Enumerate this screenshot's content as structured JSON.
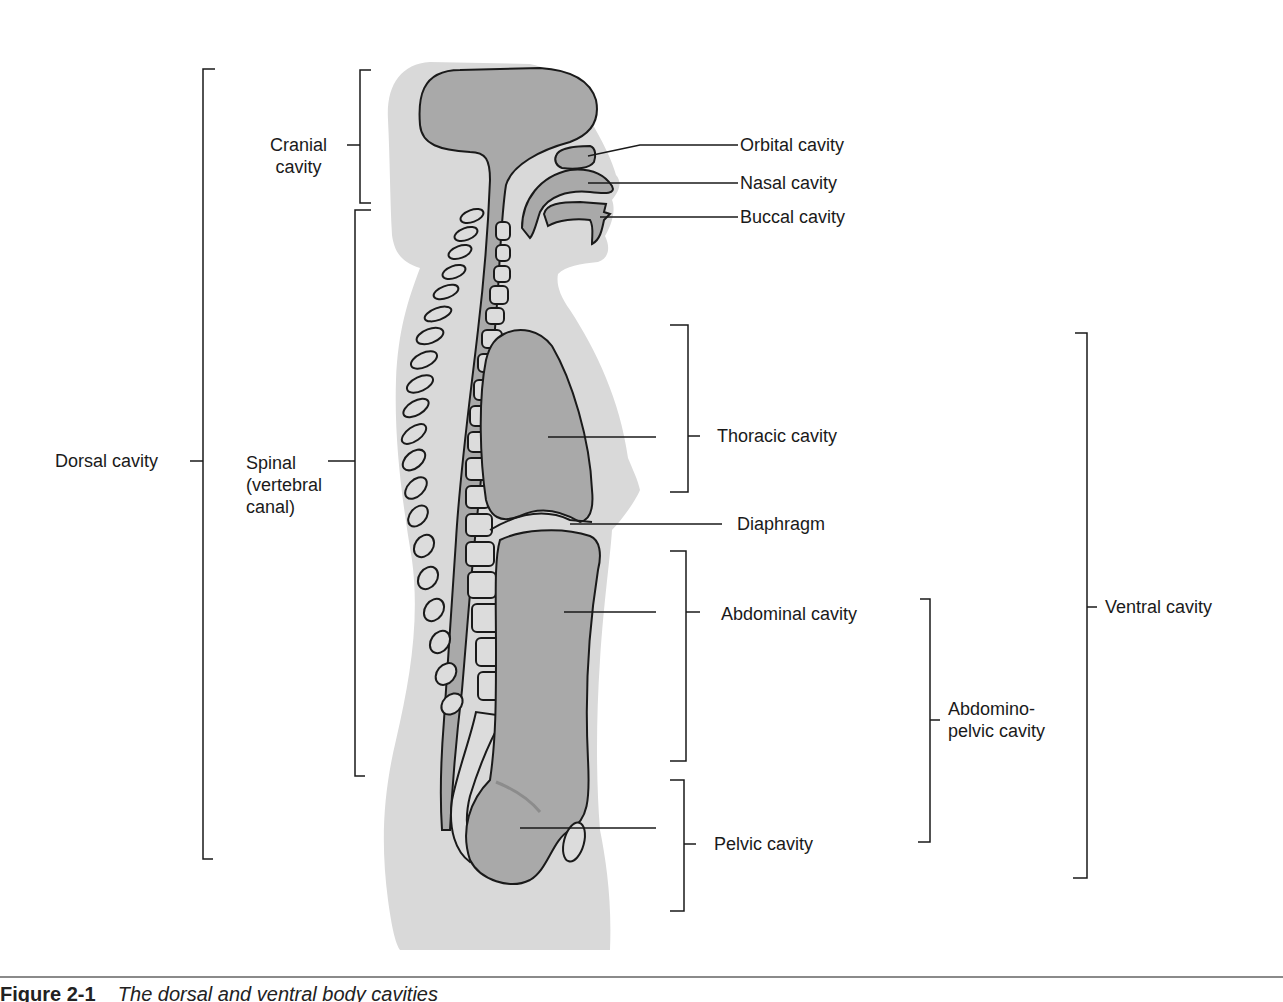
{
  "figure": {
    "type": "anatomical-diagram",
    "colors": {
      "body_fill": "#d9d9d9",
      "cavity_fill": "#a9a9a9",
      "outline": "#1a1a1a",
      "background": "#ffffff"
    }
  },
  "labels": {
    "cranial_cavity": "Cranial\ncavity",
    "dorsal_cavity": "Dorsal cavity",
    "spinal_canal": "Spinal\n(vertebral\ncanal)",
    "orbital_cavity": "Orbital cavity",
    "nasal_cavity": "Nasal cavity",
    "buccal_cavity": "Buccal cavity",
    "thoracic_cavity": "Thoracic cavity",
    "diaphragm": "Diaphragm",
    "abdominal_cavity": "Abdominal cavity",
    "abdominopelvic_cavity": "Abdomino-\npelvic cavity",
    "pelvic_cavity": "Pelvic cavity",
    "ventral_cavity": "Ventral cavity"
  },
  "caption": {
    "number": "Figure 2-1",
    "text": "The dorsal and ventral body cavities"
  }
}
